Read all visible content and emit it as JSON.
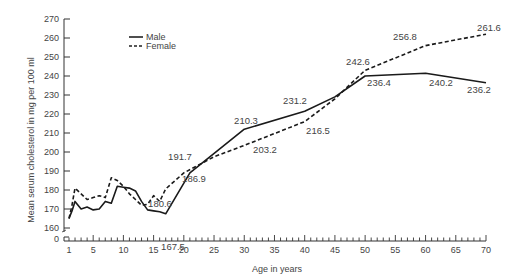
{
  "chart_data": {
    "type": "line",
    "title": "",
    "xlabel": "Age in years",
    "ylabel": "Mean serum cholesterol in mg per 100 ml",
    "xlim": [
      1,
      70
    ],
    "ylim": [
      160,
      270
    ],
    "y_axis_break": true,
    "y_axis_extra_tick": "0",
    "x_ticks": [
      1,
      5,
      10,
      15,
      20,
      25,
      30,
      35,
      40,
      45,
      50,
      55,
      60,
      65,
      70
    ],
    "y_ticks": [
      160,
      170,
      180,
      190,
      200,
      210,
      220,
      230,
      240,
      250,
      260,
      270
    ],
    "grid": false,
    "legend_position": "upper-left",
    "series": [
      {
        "name": "Male",
        "style": "solid",
        "x": [
          1,
          1.5,
          2,
          3,
          4,
          5,
          6,
          7,
          8,
          9,
          10,
          11,
          12,
          13,
          14,
          15,
          16,
          17,
          21,
          30,
          40,
          45,
          50,
          60,
          70
        ],
        "values": [
          165,
          169,
          174,
          170,
          171,
          169.5,
          170,
          174,
          173,
          182,
          181.5,
          181,
          179.5,
          174,
          169.5,
          169,
          168.5,
          167.5,
          189,
          212,
          221.5,
          229,
          240,
          241.5,
          236.5
        ]
      },
      {
        "name": "Female",
        "style": "dashed",
        "x": [
          1,
          1.5,
          2,
          3,
          4,
          5,
          6,
          7,
          8,
          9,
          10,
          11,
          12,
          13,
          14,
          15,
          16,
          17,
          20,
          25,
          30,
          40,
          45,
          50,
          60,
          70
        ],
        "values": [
          165,
          172,
          181,
          178,
          175,
          176,
          177,
          176,
          186.5,
          185,
          182,
          178,
          175,
          172,
          172.5,
          177,
          174,
          180.6,
          189,
          197.5,
          203.5,
          216,
          228,
          243,
          256,
          262
        ]
      }
    ],
    "annotations": [
      {
        "text": "167.5",
        "series": "Male"
      },
      {
        "text": "180.6",
        "series": "Female"
      },
      {
        "text": "191.7",
        "series": "Female"
      },
      {
        "text": "186.9",
        "series": "Male"
      },
      {
        "text": "210.3",
        "series": "Male"
      },
      {
        "text": "203.2",
        "series": "Female"
      },
      {
        "text": "231.2",
        "series": "Male"
      },
      {
        "text": "216.5",
        "series": "Female"
      },
      {
        "text": "242.6",
        "series": "Female"
      },
      {
        "text": "236.4",
        "series": "Male"
      },
      {
        "text": "240.2",
        "series": "Male"
      },
      {
        "text": "256.8",
        "series": "Female"
      },
      {
        "text": "236.2",
        "series": "Male"
      },
      {
        "text": "261.6",
        "series": "Female"
      }
    ]
  },
  "legend": {
    "male_label": "Male",
    "female_label": "Female"
  },
  "axes": {
    "x_title": "Age in years",
    "y_title": "Mean serum cholesterol in mg per 100 ml",
    "zero_label": "0"
  }
}
